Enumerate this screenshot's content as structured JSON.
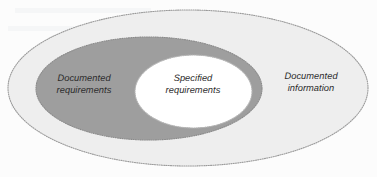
{
  "diagram": {
    "type": "nested-ellipse-venn",
    "background_color": "#fcfcfc",
    "regions": [
      {
        "id": "outer",
        "name": "documented-information",
        "label": "Documented\ninformation",
        "label_line_1": "Documented",
        "label_line_2": "information",
        "fill_color": "#eeeeee",
        "border_color": "#9a9a9a",
        "border_style": "dotted",
        "cx": 188,
        "cy": 88,
        "rx": 180,
        "ry": 78
      },
      {
        "id": "middle",
        "name": "documented-requirements",
        "label": "Documented\nrequirements",
        "label_line_1": "Documented",
        "label_line_2": "requirements",
        "fill_color": "#9e9e9e",
        "border_color": "#8a8a8a",
        "border_style": "dotted",
        "cx": 149,
        "cy": 88.5,
        "rx": 113,
        "ry": 51.5
      },
      {
        "id": "inner",
        "name": "specified-requirements",
        "label": "Specified\nrequirements",
        "label_line_1": "Specified",
        "label_line_2": "requirements",
        "fill_color": "#ffffff",
        "border_color": "#b4b4b4",
        "border_style": "dotted",
        "cx": 193.5,
        "cy": 91.5,
        "rx": 58.5,
        "ry": 36.5
      }
    ],
    "label_text_color": "#2b2b2b",
    "label_font_style": "italic"
  }
}
